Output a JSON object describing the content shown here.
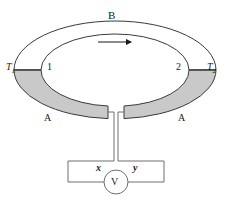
{
  "figure": {
    "labels": {
      "conductor_b": "B",
      "conductor_a_left": "A",
      "conductor_a_right": "A",
      "junction_1": "1",
      "junction_2": "2",
      "temperature_1_base": "T",
      "temperature_1_sub": "1",
      "temperature_2_base": "T",
      "temperature_2_sub": "2",
      "terminal_x": "x",
      "terminal_y": "y",
      "voltmeter": "V"
    },
    "colors": {
      "stroke": "#3a3a3a",
      "conductor_a_fill": "#c9c9c9",
      "conductor_b_fill": "#ffffff",
      "background": "#ffffff",
      "arrow": "#1a1a1a",
      "text": "#1a1a1a"
    },
    "geometry": {
      "ring_center_x": 115,
      "ring_center_y": 70,
      "outer_rx": 101,
      "outer_ry": 49,
      "inner_rx": 74,
      "inner_ry": 36,
      "voltmeter_cx": 116,
      "voltmeter_cy": 182,
      "voltmeter_r": 12
    },
    "annotations": {
      "current_arrow_direction": "right",
      "arrow_x_start": 98,
      "arrow_x_end": 134,
      "arrow_y": 42
    }
  }
}
